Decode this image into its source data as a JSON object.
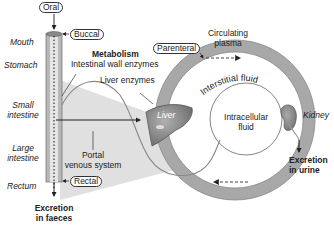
{
  "routes": {
    "oral": "Oral",
    "buccal": "Buccal",
    "rectal": "Rectal",
    "parenteral": "Parenteral"
  },
  "gut_segments": [
    "Mouth",
    "Stomach",
    "Small intestine",
    "Large intestine",
    "Rectum"
  ],
  "gut_labels": {
    "mouth": "Mouth",
    "stomach": "Stomach",
    "small_1": "Small",
    "small_2": "intestine",
    "large_1": "Large",
    "large_2": "intestine",
    "rectum": "Rectum"
  },
  "metabolism": {
    "title": "Metabolism",
    "intestinal": "Intestinal wall enzymes",
    "liver_enzymes": "Liver enzymes",
    "liver": "Liver"
  },
  "portal": {
    "line1": "Portal",
    "line2": "venous system"
  },
  "compartments": {
    "circulating_1": "Circulating",
    "circulating_2": "plasma",
    "interstitial": "Interstitial fluid",
    "intracellular_1": "Intracellular",
    "intracellular_2": "fluid"
  },
  "kidney": "Kidney",
  "excretion": {
    "faeces_1": "Excretion",
    "faeces_2": "in faeces",
    "urine_1": "Excretion",
    "urine_2": "in urine"
  },
  "colors": {
    "ring": "#a9a9a9",
    "ring_inner": "#ffffff",
    "gut_tube": "#b5b5b5",
    "cone": "#dcdcdc",
    "liver": "#8a8a8a",
    "stroke": "#333333"
  }
}
